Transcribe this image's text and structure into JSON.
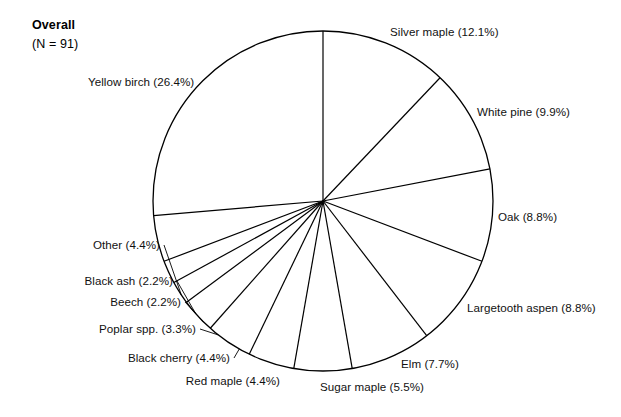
{
  "figure": {
    "title": "Overall",
    "subtitle": "(N = 91)",
    "background_color": "#ffffff",
    "stroke_color": "#000000"
  },
  "chart_data": {
    "type": "pie",
    "title": "Overall",
    "subtitle": "(N = 91)",
    "total_n": 91,
    "units": "percent",
    "start_angle_deg": 0,
    "direction": "clockwise",
    "grid": false,
    "legend": "none",
    "labels_placement": "outside-leader",
    "categories": [
      "Silver maple",
      "White pine",
      "Oak",
      "Largetooth aspen",
      "Elm",
      "Sugar maple",
      "Red maple",
      "Black cherry",
      "Poplar spp.",
      "Beech",
      "Black ash",
      "Other",
      "Yellow birch"
    ],
    "values": [
      12.1,
      9.9,
      8.8,
      8.8,
      7.7,
      5.5,
      4.4,
      4.4,
      3.3,
      2.2,
      2.2,
      4.4,
      26.4
    ],
    "slices": [
      {
        "label": "Silver maple (12.1%)",
        "name": "Silver maple",
        "value": 12.1
      },
      {
        "label": "White pine (9.9%)",
        "name": "White pine",
        "value": 9.9
      },
      {
        "label": "Oak (8.8%)",
        "name": "Oak",
        "value": 8.8
      },
      {
        "label": "Largetooth aspen (8.8%)",
        "name": "Largetooth aspen",
        "value": 8.8
      },
      {
        "label": "Elm (7.7%)",
        "name": "Elm",
        "value": 7.7
      },
      {
        "label": "Sugar maple (5.5%)",
        "name": "Sugar maple",
        "value": 5.5
      },
      {
        "label": "Red maple (4.4%)",
        "name": "Red maple",
        "value": 4.4
      },
      {
        "label": "Black cherry (4.4%)",
        "name": "Black cherry",
        "value": 4.4
      },
      {
        "label": "Poplar spp. (3.3%)",
        "name": "Poplar spp.",
        "value": 3.3
      },
      {
        "label": "Beech (2.2%)",
        "name": "Beech",
        "value": 2.2
      },
      {
        "label": "Black ash (2.2%)",
        "name": "Black ash",
        "value": 2.2
      },
      {
        "label": "Other (4.4%)",
        "name": "Other",
        "value": 4.4
      },
      {
        "label": "Yellow birch (26.4%)",
        "name": "Yellow birch",
        "value": 26.4
      }
    ]
  },
  "labels": {
    "silver_maple": "Silver maple (12.1%)",
    "white_pine": "White pine (9.9%)",
    "oak": "Oak (8.8%)",
    "largetooth_aspen": "Largetooth aspen (8.8%)",
    "elm": "Elm (7.7%)",
    "sugar_maple": "Sugar maple (5.5%)",
    "red_maple": "Red maple (4.4%)",
    "black_cherry": "Black cherry (4.4%)",
    "poplar_spp": "Poplar spp. (3.3%)",
    "beech": "Beech (2.2%)",
    "black_ash": "Black ash (2.2%)",
    "other": "Other (4.4%)",
    "yellow_birch": "Yellow birch (26.4%)"
  }
}
